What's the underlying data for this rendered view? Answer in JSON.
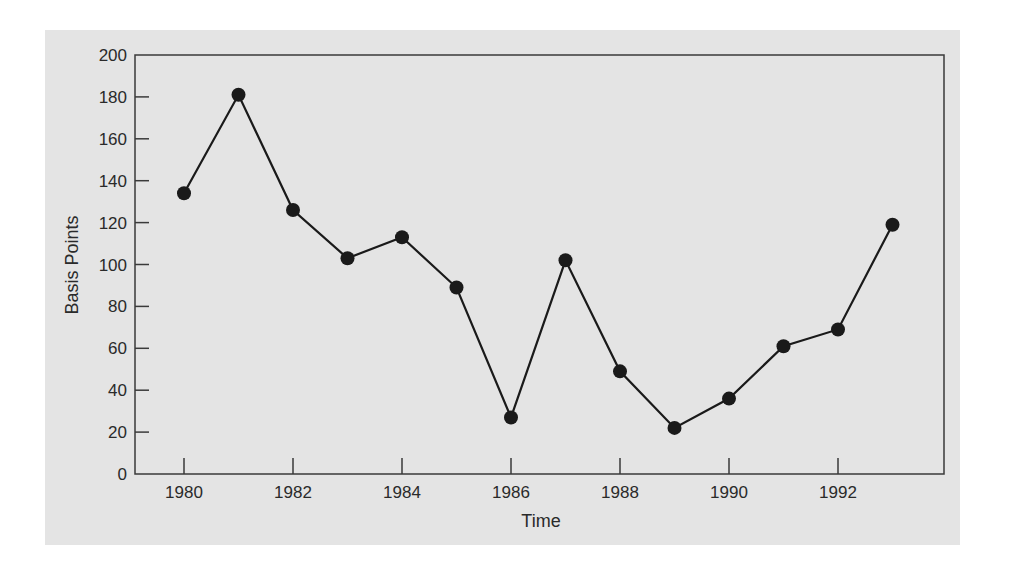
{
  "chart_data": {
    "type": "line",
    "title": "",
    "xlabel": "Time",
    "ylabel": "Basis Points",
    "x": [
      1980,
      1981,
      1982,
      1983,
      1984,
      1985,
      1986,
      1987,
      1988,
      1989,
      1990,
      1991,
      1992,
      1993
    ],
    "series": [
      {
        "name": "Basis Points",
        "values": [
          134,
          181,
          126,
          103,
          113,
          89,
          27,
          102,
          49,
          22,
          36,
          61,
          69,
          119
        ],
        "marker": "filled-circle",
        "color": "#1a1a1a"
      }
    ],
    "xticks": [
      "1980",
      "1982",
      "1984",
      "1986",
      "1988",
      "1990",
      "1992"
    ],
    "yticks": [
      "0",
      "20",
      "40",
      "60",
      "80",
      "100",
      "120",
      "140",
      "160",
      "180",
      "200"
    ],
    "xlim": [
      1979.1,
      1994.1
    ],
    "ylim": [
      0,
      200
    ],
    "grid": false,
    "legend": "none"
  },
  "colors": {
    "panel_background": "#e4e4e4",
    "axis": "#3a3a3a",
    "line": "#1a1a1a"
  }
}
